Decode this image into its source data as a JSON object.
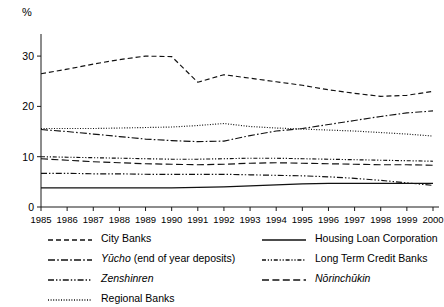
{
  "axis": {
    "unit_label": "%",
    "y_ticks": [
      "0",
      "10",
      "20",
      "30"
    ],
    "x_ticks": [
      "1985",
      "1986",
      "1987",
      "1988",
      "1989",
      "1990",
      "1991",
      "1992",
      "1993",
      "1994",
      "1995",
      "1996",
      "1997",
      "1998",
      "1999",
      "2000"
    ]
  },
  "legend": {
    "left_column": [
      {
        "label": "City Banks",
        "italic": false,
        "style": "dashed",
        "key": "city-banks"
      },
      {
        "label": "Yūcho (end of year deposits)",
        "italic": true,
        "italic_part": "Yūcho",
        "roman_part": " (end of year deposits)",
        "style": "dash-dot",
        "key": "yucho"
      },
      {
        "label": "Zenshinren",
        "italic": true,
        "style": "dash-dot-dot",
        "key": "zenshinren"
      },
      {
        "label": "Regional Banks",
        "italic": false,
        "style": "dotted",
        "key": "regional-banks"
      }
    ],
    "right_column": [
      {
        "label": "Housing Loan Corporation",
        "italic": false,
        "style": "solid",
        "key": "housing-loan-corporation"
      },
      {
        "label": "Long Term Credit Banks",
        "italic": false,
        "style": "dash-dot-dot-fine",
        "key": "long-term-credit-banks"
      },
      {
        "label": "Nōrinchūkin",
        "italic": true,
        "style": "long-dash",
        "key": "norinchukin"
      }
    ]
  },
  "chart_data": {
    "type": "line",
    "title": "",
    "xlabel": "",
    "ylabel": "%",
    "ylim": [
      0,
      33
    ],
    "yticks": [
      0,
      10,
      20,
      30
    ],
    "grid": false,
    "legend_position": "bottom",
    "x": [
      1985,
      1986,
      1987,
      1988,
      1989,
      1990,
      1991,
      1992,
      1993,
      1994,
      1995,
      1996,
      1997,
      1998,
      1999,
      2000
    ],
    "series": [
      {
        "name": "City Banks",
        "key": "city-banks",
        "style": "dashed",
        "values": [
          26.5,
          27.4,
          28.4,
          29.3,
          30.0,
          29.9,
          24.8,
          26.3,
          25.6,
          24.9,
          24.2,
          23.3,
          22.6,
          22.0,
          22.2,
          23.0
        ]
      },
      {
        "name": "Yūcho (end of year deposits)",
        "key": "yucho",
        "style": "dash-dot",
        "values": [
          15.4,
          15.0,
          14.5,
          14.0,
          13.5,
          13.2,
          13.0,
          13.1,
          14.2,
          15.1,
          15.6,
          16.4,
          17.2,
          18.0,
          18.7,
          19.1
        ]
      },
      {
        "name": "Zenshinren",
        "key": "zenshinren",
        "style": "dash-dot-dot",
        "values": [
          6.7,
          6.7,
          6.6,
          6.6,
          6.5,
          6.5,
          6.5,
          6.5,
          6.4,
          6.3,
          6.2,
          6.0,
          5.7,
          5.3,
          4.8,
          4.3
        ]
      },
      {
        "name": "Regional Banks",
        "key": "regional-banks",
        "style": "dotted",
        "values": [
          15.6,
          15.6,
          15.6,
          15.7,
          15.8,
          15.9,
          16.2,
          16.6,
          16.0,
          15.7,
          15.5,
          15.3,
          15.1,
          14.8,
          14.5,
          14.1
        ]
      },
      {
        "name": "Housing Loan Corporation",
        "key": "housing-loan-corporation",
        "style": "solid",
        "values": [
          3.8,
          3.8,
          3.8,
          3.8,
          3.8,
          3.8,
          3.9,
          4.0,
          4.2,
          4.4,
          4.6,
          4.7,
          4.7,
          4.7,
          4.7,
          4.7
        ]
      },
      {
        "name": "Long Term Credit Banks",
        "key": "long-term-credit-banks",
        "style": "dash-dot-dot-fine",
        "values": [
          10.0,
          9.9,
          9.8,
          9.7,
          9.6,
          9.5,
          9.5,
          9.6,
          9.7,
          9.7,
          9.6,
          9.5,
          9.4,
          9.3,
          9.2,
          9.1
        ]
      },
      {
        "name": "Nōrinchūkin",
        "key": "norinchukin",
        "style": "long-dash",
        "values": [
          9.6,
          9.3,
          9.0,
          8.8,
          8.6,
          8.5,
          8.4,
          8.5,
          8.7,
          8.8,
          8.7,
          8.6,
          8.5,
          8.4,
          8.4,
          8.3
        ]
      }
    ]
  }
}
